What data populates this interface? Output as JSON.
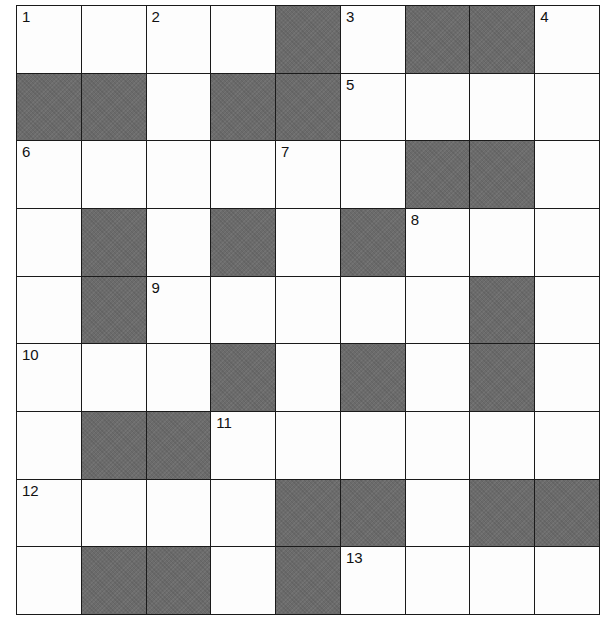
{
  "puzzle": {
    "rows": 9,
    "cols": 9,
    "block_color": "#6b6b6b",
    "line_color": "#1a1a1a",
    "grid": [
      "WWWWBWBBW",
      "BBWBBWWWW",
      "WWWWWWBBW",
      "WBWBWBWWW",
      "WBWWWWWBW",
      "WWWBWBWBW",
      "WBBWWWWWW",
      "WWWWBBWBB",
      "WBBWBWWWW"
    ],
    "numbers": [
      {
        "label": "1",
        "row": 0,
        "col": 0
      },
      {
        "label": "2",
        "row": 0,
        "col": 2
      },
      {
        "label": "3",
        "row": 0,
        "col": 5
      },
      {
        "label": "4",
        "row": 0,
        "col": 8
      },
      {
        "label": "5",
        "row": 1,
        "col": 5
      },
      {
        "label": "6",
        "row": 2,
        "col": 0
      },
      {
        "label": "7",
        "row": 2,
        "col": 4
      },
      {
        "label": "8",
        "row": 3,
        "col": 6
      },
      {
        "label": "9",
        "row": 4,
        "col": 2
      },
      {
        "label": "10",
        "row": 5,
        "col": 0
      },
      {
        "label": "11",
        "row": 6,
        "col": 3
      },
      {
        "label": "12",
        "row": 7,
        "col": 0
      },
      {
        "label": "13",
        "row": 8,
        "col": 5
      }
    ]
  }
}
